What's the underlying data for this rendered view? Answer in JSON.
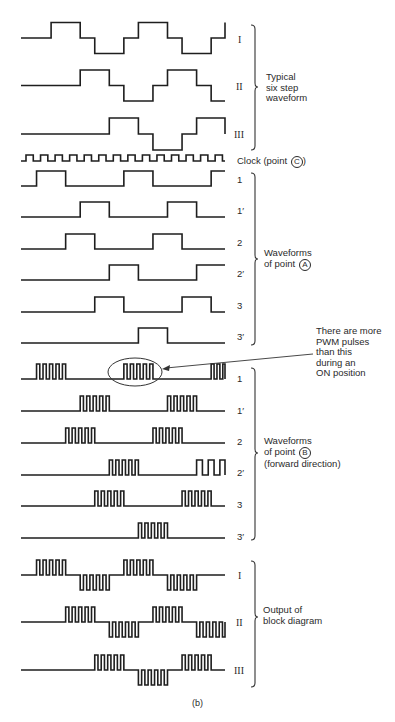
{
  "figure": {
    "caption": "(b)",
    "groups": [
      {
        "id": "six_step",
        "description_lines": [
          "Typical",
          "six step",
          "waveform"
        ],
        "rows": [
          {
            "label": "I"
          },
          {
            "label": "II"
          },
          {
            "label": "III"
          }
        ]
      },
      {
        "id": "clock",
        "label_prefix": "Clock (point ",
        "label_circle": "C",
        "label_suffix": ")"
      },
      {
        "id": "point_a",
        "description_lines": [
          "Waveforms",
          "of point "
        ],
        "description_circle": "A",
        "rows": [
          {
            "label": "1"
          },
          {
            "label": "1′"
          },
          {
            "label": "2"
          },
          {
            "label": "2′"
          },
          {
            "label": "3"
          },
          {
            "label": "3′"
          }
        ]
      },
      {
        "id": "point_b",
        "description_lines": [
          "Waveforms",
          "of point ",
          "(forward direction)"
        ],
        "description_circle": "B",
        "rows": [
          {
            "label": "1"
          },
          {
            "label": "1′"
          },
          {
            "label": "2"
          },
          {
            "label": "2′"
          },
          {
            "label": "3"
          },
          {
            "label": "3′"
          }
        ]
      },
      {
        "id": "output",
        "description_lines": [
          "Output of",
          "block diagram"
        ],
        "rows": [
          {
            "label": "I"
          },
          {
            "label": "II"
          },
          {
            "label": "III"
          }
        ]
      }
    ],
    "annotation": {
      "text": "There are more\nPWM pulses\nthan this\nduring an\nON position"
    }
  },
  "chart_data": {
    "type": "timing-diagram",
    "title": "",
    "x_start": 21,
    "x_end": 225,
    "step_px": 14.55,
    "six_step_levels": {
      "I": [
        0,
        0,
        1,
        1,
        0,
        -1,
        -1,
        0,
        1,
        1,
        0,
        -1,
        -1,
        0,
        1
      ],
      "II": [
        0,
        0,
        0,
        0,
        1,
        1,
        0,
        -1,
        -1,
        0,
        1,
        1,
        0,
        -1
      ],
      "III": [
        0,
        0,
        0,
        0,
        0,
        0,
        1,
        1,
        0,
        -1,
        -1,
        0,
        1,
        1,
        0
      ]
    },
    "point_a_on_steps": {
      "1": [
        [
          1,
          3
        ],
        [
          7,
          9
        ],
        [
          13,
          14
        ]
      ],
      "1'": [
        [
          4,
          6
        ],
        [
          10,
          12
        ]
      ],
      "2": [
        [
          3,
          5
        ],
        [
          9,
          11
        ]
      ],
      "2'": [
        [
          6,
          8
        ],
        [
          12,
          14
        ]
      ],
      "3": [
        [
          5,
          7
        ],
        [
          11,
          13
        ]
      ],
      "3'": [
        [
          8,
          10
        ]
      ]
    },
    "pwm_pulses_per_block": 5
  }
}
